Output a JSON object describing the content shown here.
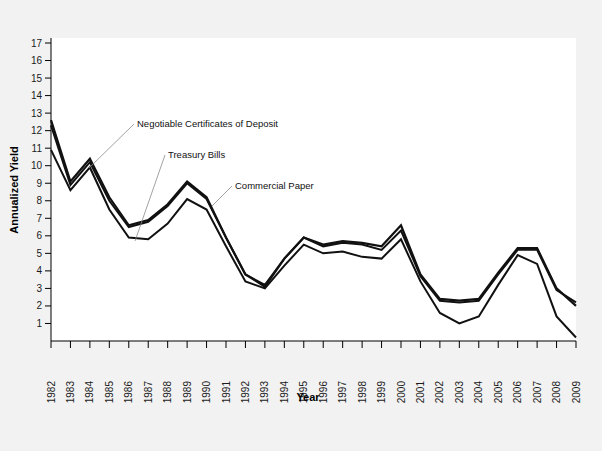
{
  "chart_data": {
    "type": "line",
    "title": "",
    "xlabel": "Year",
    "ylabel": "Annualized Yield",
    "xlim": [
      1982,
      2009
    ],
    "ylim": [
      0,
      17
    ],
    "grid": false,
    "legend_position": "inline-annotations",
    "x": [
      1982,
      1983,
      1984,
      1985,
      1986,
      1987,
      1988,
      1989,
      1990,
      1991,
      1992,
      1993,
      1994,
      1995,
      1996,
      1997,
      1998,
      1999,
      2000,
      2001,
      2002,
      2003,
      2004,
      2005,
      2006,
      2007,
      2008,
      2009
    ],
    "xticklabels": [
      "1982",
      "1983",
      "1984",
      "1985",
      "1986",
      "1987",
      "1988",
      "1989",
      "1990",
      "1991",
      "1992",
      "1993",
      "1994",
      "1995",
      "1996",
      "1997",
      "1998",
      "1999",
      "2000",
      "2001",
      "2002",
      "2003",
      "2004",
      "2005",
      "2006",
      "2007",
      "2008",
      "2009"
    ],
    "yticks": [
      1,
      2,
      3,
      4,
      5,
      6,
      7,
      8,
      9,
      10,
      11,
      12,
      13,
      14,
      15,
      16,
      17
    ],
    "yticklabels": [
      "1",
      "2",
      "3",
      "4",
      "5",
      "6",
      "7",
      "8",
      "9",
      "10",
      "11",
      "12",
      "13",
      "14",
      "15",
      "16",
      "17"
    ],
    "series": [
      {
        "name": "Negotiable Certificates of Deposit",
        "color": "#111111",
        "values": [
          12.6,
          9.1,
          10.4,
          8.2,
          6.6,
          6.9,
          7.8,
          9.1,
          8.2,
          5.9,
          3.8,
          3.1,
          4.7,
          5.9,
          5.5,
          5.7,
          5.6,
          5.4,
          6.6,
          3.8,
          2.4,
          2.3,
          2.4,
          3.9,
          5.3,
          5.3,
          3.0,
          2.0
        ]
      },
      {
        "name": "Commercial Paper",
        "color": "#111111",
        "values": [
          12.3,
          8.9,
          10.2,
          8.0,
          6.5,
          6.8,
          7.7,
          9.0,
          8.1,
          5.9,
          3.8,
          3.2,
          4.7,
          5.9,
          5.4,
          5.6,
          5.5,
          5.2,
          6.3,
          3.7,
          2.3,
          2.2,
          2.3,
          3.8,
          5.2,
          5.2,
          2.9,
          2.2
        ]
      },
      {
        "name": "Treasury Bills",
        "color": "#111111",
        "values": [
          10.9,
          8.6,
          9.9,
          7.5,
          5.9,
          5.8,
          6.7,
          8.1,
          7.5,
          5.4,
          3.4,
          3.0,
          4.3,
          5.5,
          5.0,
          5.1,
          4.8,
          4.7,
          5.8,
          3.4,
          1.6,
          1.0,
          1.4,
          3.2,
          4.9,
          4.4,
          1.4,
          0.2
        ]
      }
    ],
    "annotations": [
      {
        "id": "annot-cd",
        "label": "Negotiable Certificates of Deposit",
        "points_to_series": "Negotiable Certificates of Deposit"
      },
      {
        "id": "annot-tbills",
        "label": "Treasury Bills",
        "points_to_series": "Treasury Bills"
      },
      {
        "id": "annot-cp",
        "label": "Commercial Paper",
        "points_to_series": "Commercial Paper"
      }
    ]
  },
  "colors": {
    "page_background": "#f2f2f2",
    "plot_background": "#ffffff",
    "axis": "#000000",
    "line": "#111111",
    "leader": "#8a8a8a"
  }
}
